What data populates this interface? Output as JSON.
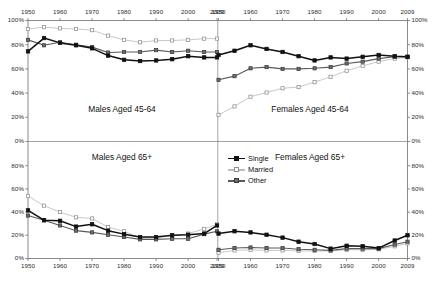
{
  "figure": {
    "width": 435,
    "height": 284,
    "background": "#ffffff"
  },
  "legend": {
    "position": "center-left of bottom-right panel",
    "entries": [
      {
        "label": "Single",
        "marker": "filled-square",
        "color": "#111111",
        "fill": "#111111"
      },
      {
        "label": "Married",
        "marker": "open-square",
        "color": "#bdbdbd",
        "fill": "#ffffff"
      },
      {
        "label": "Other",
        "marker": "gray-square",
        "color": "#5a5a5a",
        "fill": "#6e6e6e"
      }
    ]
  },
  "axis": {
    "x_ticks": [
      "1950",
      "1960",
      "1970",
      "1980",
      "1990",
      "2000",
      "2009"
    ],
    "y_ticks_full": [
      "0%",
      "20%",
      "40%",
      "60%",
      "80%",
      "100%"
    ],
    "y_ticks_lower": [
      "0%",
      "20%",
      "40%",
      "60%",
      "80%"
    ],
    "xlim": [
      1950,
      2009
    ],
    "ylim": [
      0,
      100
    ]
  },
  "chart_data": {
    "type": "line",
    "xlabel": "",
    "ylabel": "",
    "xlim": [
      1950,
      2009
    ],
    "ylim": [
      0,
      100
    ],
    "grid": false,
    "legend_position": "bottom-right panel, upper-left",
    "legend_entries": [
      "Single",
      "Married",
      "Other"
    ],
    "x": [
      1950,
      1955,
      1960,
      1965,
      1970,
      1975,
      1980,
      1985,
      1990,
      1995,
      2000,
      2005,
      2009
    ],
    "panels": [
      {
        "id": "males-45-64",
        "title": "Males Aged 45-64",
        "position": "top-left",
        "series": [
          {
            "name": "Single",
            "values": [
              74.5,
              85.5,
              81.5,
              79.5,
              77.0,
              71.0,
              67.5,
              66.5,
              67.0,
              68.0,
              70.5,
              69.5,
              69.5
            ]
          },
          {
            "name": "Married",
            "values": [
              93.0,
              94.5,
              93.5,
              93.0,
              92.0,
              87.5,
              84.0,
              82.0,
              83.5,
              83.5,
              84.0,
              85.0,
              85.0
            ]
          },
          {
            "name": "Other",
            "values": [
              84.0,
              79.5,
              82.0,
              80.0,
              78.0,
              73.5,
              74.0,
              74.0,
              75.5,
              74.0,
              75.0,
              74.0,
              74.0
            ]
          }
        ]
      },
      {
        "id": "females-45-64",
        "title": "Females Aged 45-64",
        "position": "top-right",
        "series": [
          {
            "name": "Single",
            "values": [
              71.5,
              75.0,
              79.5,
              76.5,
              74.0,
              70.5,
              67.0,
              69.5,
              68.5,
              70.0,
              71.5,
              70.5,
              70.0
            ]
          },
          {
            "name": "Married",
            "values": [
              22.0,
              29.0,
              37.0,
              40.5,
              44.0,
              45.0,
              49.0,
              53.5,
              58.5,
              62.5,
              66.0,
              68.5,
              69.5
            ]
          },
          {
            "name": "Other",
            "values": [
              51.0,
              54.0,
              60.5,
              61.5,
              60.0,
              60.0,
              60.5,
              61.5,
              64.5,
              66.0,
              68.5,
              70.0,
              70.0
            ]
          }
        ]
      },
      {
        "id": "males-65-plus",
        "title": "Males Aged 65+",
        "position": "bottom-left",
        "series": [
          {
            "name": "Single",
            "values": [
              41.5,
              33.0,
              32.5,
              27.5,
              29.5,
              24.0,
              21.0,
              18.5,
              18.5,
              20.0,
              20.5,
              21.5,
              28.5
            ]
          },
          {
            "name": "Married",
            "values": [
              54.0,
              45.5,
              40.0,
              35.5,
              34.5,
              27.0,
              23.5,
              17.5,
              18.0,
              19.5,
              21.5,
              25.5,
              29.5
            ]
          },
          {
            "name": "Other",
            "values": [
              37.0,
              33.0,
              28.5,
              24.0,
              22.5,
              20.5,
              18.5,
              16.5,
              16.5,
              17.0,
              17.0,
              21.0,
              23.5
            ]
          }
        ]
      },
      {
        "id": "females-65-plus",
        "title": "Females Aged 65+",
        "position": "bottom-right",
        "series": [
          {
            "name": "Single",
            "values": [
              21.5,
              23.5,
              22.5,
              20.5,
              18.0,
              14.5,
              12.5,
              8.5,
              11.0,
              10.5,
              9.0,
              15.5,
              20.0
            ]
          },
          {
            "name": "Married",
            "values": [
              5.0,
              7.0,
              7.5,
              7.0,
              7.0,
              6.5,
              6.5,
              6.5,
              7.5,
              7.5,
              8.0,
              10.5,
              13.0
            ]
          },
          {
            "name": "Other",
            "values": [
              7.5,
              9.0,
              9.5,
              9.0,
              9.0,
              8.0,
              7.5,
              7.0,
              8.5,
              8.5,
              8.5,
              12.0,
              14.5
            ]
          }
        ]
      }
    ]
  }
}
